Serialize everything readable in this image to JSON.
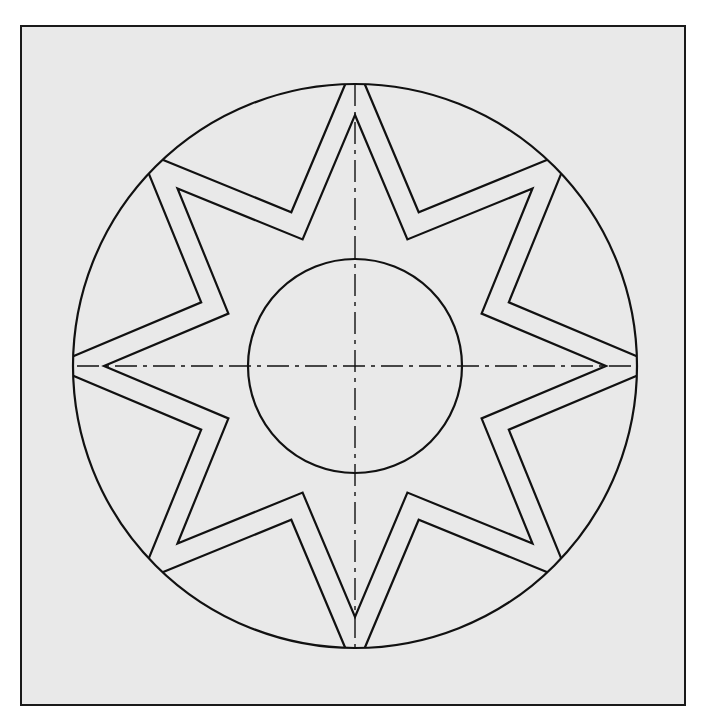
{
  "drawing": {
    "title": "",
    "background": "#e9e9e9",
    "stroke": "#111111",
    "frame": {
      "x": 20,
      "y": 25,
      "width": 666,
      "height": 681
    },
    "center": {
      "x": 355,
      "y": 366
    },
    "outer_circle": {
      "r": 282
    },
    "inner_circle": {
      "r": 107
    },
    "star": {
      "points": 8,
      "tip_radius": 251,
      "valley_radius": 137,
      "band_offset": 21
    },
    "centerlines": {
      "horizontal": {
        "x1": 77,
        "x2": 633
      },
      "vertical": {
        "y1": 84,
        "y2": 648
      },
      "dash_pattern": "22 6 4 6"
    }
  }
}
